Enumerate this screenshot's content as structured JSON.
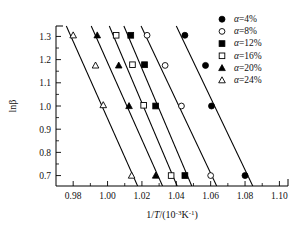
{
  "chart_data": {
    "type": "scatter",
    "title": "",
    "subtitle": "",
    "xlabel": "1/T/(10^-3 K^-1)",
    "xlabel_parts": {
      "pre": "1/",
      "ital": "T",
      "mid": "/(10",
      "sup1": "-3",
      "unit": "K",
      "sup2": "-1",
      "post": ")"
    },
    "ylabel": "lnβ",
    "xlim": [
      0.97,
      1.105
    ],
    "ylim": [
      0.655,
      1.345
    ],
    "xticks": [
      "0.98",
      "1.00",
      "1.02",
      "1.04",
      "1.06",
      "1.08",
      "1.10"
    ],
    "xtick_values": [
      0.98,
      1.0,
      1.02,
      1.04,
      1.06,
      1.08,
      1.1
    ],
    "xminor_values": [
      0.99,
      1.01,
      1.03,
      1.05,
      1.07,
      1.09
    ],
    "yticks": [
      "0.7",
      "0.8",
      "0.9",
      "1.0",
      "1.1",
      "1.2",
      "1.3"
    ],
    "ytick_values": [
      0.7,
      0.8,
      0.9,
      1.0,
      1.1,
      1.2,
      1.3
    ],
    "yminor_values": [
      0.75,
      0.85,
      0.95,
      1.05,
      1.15,
      1.25
    ],
    "grid": false,
    "legend_position": "top-right",
    "series": [
      {
        "name": "α=4%",
        "marker": "filled-circle",
        "color": "#000000",
        "x": [
          1.045,
          1.057,
          1.0605,
          1.08
        ],
        "y": [
          1.305,
          1.175,
          1.0,
          0.7
        ],
        "fit": {
          "x0": 1.04,
          "y0": 1.345,
          "x1": 1.0845,
          "y1": 0.655
        }
      },
      {
        "name": "α=8%",
        "marker": "open-circle",
        "color": "#000000",
        "x": [
          1.023,
          1.0335,
          1.043,
          1.06
        ],
        "y": [
          1.305,
          1.175,
          1.0,
          0.7
        ],
        "fit": {
          "x0": 1.0195,
          "y0": 1.345,
          "x1": 1.0635,
          "y1": 0.655
        }
      },
      {
        "name": "α=12%",
        "marker": "filled-square",
        "color": "#000000",
        "x": [
          1.0135,
          1.0215,
          1.028,
          1.045
        ],
        "y": [
          1.305,
          1.178,
          1.0,
          0.7
        ],
        "fit": {
          "x0": 1.0095,
          "y0": 1.345,
          "x1": 1.049,
          "y1": 0.655
        }
      },
      {
        "name": "α=16%",
        "marker": "open-square",
        "color": "#000000",
        "x": [
          1.005,
          1.0145,
          1.021,
          1.037
        ],
        "y": [
          1.305,
          1.178,
          1.003,
          0.7
        ],
        "fit": {
          "x0": 1.001,
          "y0": 1.345,
          "x1": 1.0405,
          "y1": 0.655
        }
      },
      {
        "name": "α=20%",
        "marker": "filled-triangle",
        "color": "#000000",
        "x": [
          0.994,
          1.0065,
          1.0125,
          1.028
        ],
        "y": [
          1.305,
          1.175,
          1.0,
          0.7
        ],
        "fit": {
          "x0": 0.9905,
          "y0": 1.345,
          "x1": 1.032,
          "y1": 0.655
        }
      },
      {
        "name": "α=24%",
        "marker": "open-triangle",
        "color": "#000000",
        "x": [
          0.98,
          0.993,
          0.9975,
          1.014
        ],
        "y": [
          1.305,
          1.175,
          1.004,
          0.7
        ],
        "fit": {
          "x0": 0.976,
          "y0": 1.345,
          "x1": 1.0175,
          "y1": 0.655
        }
      }
    ]
  },
  "legend": {
    "entries": [
      {
        "label": "α=4%",
        "marker": "filled-circle"
      },
      {
        "label": "α=8%",
        "marker": "open-circle"
      },
      {
        "label": "α=12%",
        "marker": "filled-square"
      },
      {
        "label": "α=16%",
        "marker": "open-square"
      },
      {
        "label": "α=20%",
        "marker": "filled-triangle"
      },
      {
        "label": "α=24%",
        "marker": "open-triangle"
      }
    ]
  }
}
